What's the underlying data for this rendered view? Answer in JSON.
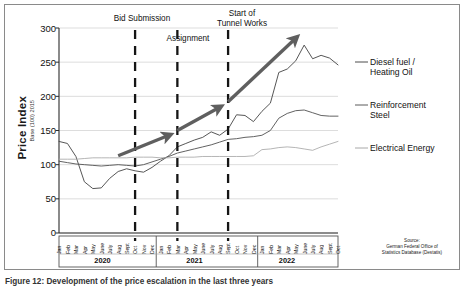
{
  "figure": {
    "caption": "Figure 12:  Development of the price escalation in the last three years",
    "source_note": "Source:\nGerman Federal Office of\nStatistics Database (Destatis)"
  },
  "axes": {
    "ylabel": "Price Index",
    "ylabel_sub": "Base (100) 2015",
    "yticks": [
      300,
      250,
      200,
      150,
      100,
      50,
      0
    ],
    "ylim": [
      0,
      300
    ],
    "years": [
      "2020",
      "2021",
      "2022"
    ],
    "months_2020": [
      "Jan",
      "Feb",
      "Mar",
      "Apr",
      "May",
      "June",
      "July",
      "Aug",
      "Sept",
      "Oct",
      "Nov",
      "Dec"
    ],
    "months_2021": [
      "Jan",
      "Feb",
      "Mar",
      "Apr",
      "May",
      "June",
      "July",
      "Aug",
      "Sept",
      "Oct",
      "Nov",
      "Dec"
    ],
    "months_2022": [
      "Jan",
      "Feb",
      "Mar",
      "Apr",
      "May",
      "June",
      "July",
      "Aug",
      "Sept",
      "Oct"
    ]
  },
  "legend": {
    "entries": [
      {
        "name": "diesel",
        "label": "Diesel fuel /\nHeating Oil",
        "color": "#4d4d4d"
      },
      {
        "name": "steel",
        "label": "Reinforcement\nSteel",
        "color": "#5a5a5a"
      },
      {
        "name": "electrical",
        "label": "Electrical Energy",
        "color": "#a8a8a8"
      }
    ]
  },
  "annotations": [
    {
      "name": "bid-submission",
      "label": "Bid Submission",
      "month": "Oct 2020"
    },
    {
      "name": "assignment",
      "label": "Assignment",
      "month": "Mar 2021"
    },
    {
      "name": "start-tunnel-works",
      "label": "Start of\nTunnel Works",
      "month": "Sept 2021"
    }
  ],
  "chart_data": {
    "type": "line",
    "title": "",
    "subtitle": "",
    "xlabel": "",
    "ylabel": "Price Index Base (100) 2015",
    "ylim": [
      0,
      300
    ],
    "yticks": [
      0,
      50,
      100,
      150,
      200,
      250,
      300
    ],
    "grid": "horizontal",
    "legend_position": "right",
    "x": [
      "Jan 2020",
      "Feb 2020",
      "Mar 2020",
      "Apr 2020",
      "May 2020",
      "June 2020",
      "July 2020",
      "Aug 2020",
      "Sept 2020",
      "Oct 2020",
      "Nov 2020",
      "Dec 2020",
      "Jan 2021",
      "Feb 2021",
      "Mar 2021",
      "Apr 2021",
      "May 2021",
      "June 2021",
      "July 2021",
      "Aug 2021",
      "Sept 2021",
      "Oct 2021",
      "Nov 2021",
      "Dec 2021",
      "Jan 2022",
      "Feb 2022",
      "Mar 2022",
      "Apr 2022",
      "May 2022",
      "June 2022",
      "July 2022",
      "Aug 2022",
      "Sept 2022",
      "Oct 2022"
    ],
    "series": [
      {
        "name": "Diesel fuel / Heating Oil",
        "color": "#4d4d4d",
        "values": [
          134,
          131,
          112,
          75,
          65,
          66,
          80,
          90,
          94,
          91,
          89,
          96,
          105,
          113,
          126,
          131,
          136,
          140,
          148,
          143,
          152,
          173,
          172,
          163,
          178,
          190,
          235,
          240,
          252,
          275,
          255,
          260,
          256,
          246
        ]
      },
      {
        "name": "Reinforcement Steel",
        "color": "#5a5a5a",
        "values": [
          105,
          103,
          101,
          100,
          99,
          98,
          99,
          100,
          99,
          98,
          100,
          104,
          108,
          112,
          117,
          120,
          123,
          126,
          129,
          133,
          137,
          138,
          140,
          141,
          143,
          150,
          168,
          175,
          179,
          180,
          176,
          172,
          171,
          171
        ]
      },
      {
        "name": "Electrical Energy",
        "color": "#a8a8a8",
        "values": [
          108,
          108,
          108,
          109,
          110,
          110,
          110,
          110,
          110,
          111,
          111,
          111,
          110,
          110,
          111,
          111,
          111,
          112,
          112,
          112,
          112,
          112,
          112,
          113,
          122,
          123,
          125,
          126,
          125,
          123,
          121,
          126,
          130,
          134
        ]
      }
    ],
    "event_markers": [
      {
        "label": "Bid Submission",
        "x": "Oct 2020"
      },
      {
        "label": "Assignment",
        "x": "Mar 2021"
      },
      {
        "label": "Start of Tunnel Works",
        "x": "Sept 2021"
      }
    ],
    "trend_arrows": [
      {
        "from": [
          "Aug 2020",
          113
        ],
        "to": [
          "Feb 2021",
          143
        ]
      },
      {
        "from": [
          "Mar 2021",
          150
        ],
        "to": [
          "Aug 2021",
          184
        ]
      },
      {
        "from": [
          "Sept 2021",
          192
        ],
        "to": [
          "May 2022",
          285
        ]
      }
    ]
  }
}
